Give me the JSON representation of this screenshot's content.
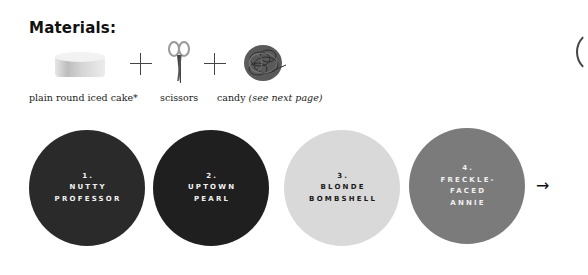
{
  "materials": {
    "title": "Materials:",
    "items": [
      {
        "icon": "cake-icon",
        "caption": "plain round iced cake*"
      },
      {
        "icon": "scissors-icon",
        "caption": "scissors"
      },
      {
        "icon": "candy-icon",
        "caption": "candy",
        "caption_note": "(see next page)"
      }
    ],
    "separator": "+"
  },
  "styles": [
    {
      "number": "1.",
      "lines": [
        "NUTTY",
        "PROFESSOR"
      ],
      "color": "#2a2a2a",
      "text_color": "#f2f2f2"
    },
    {
      "number": "2.",
      "lines": [
        "UPTOWN",
        "PEARL"
      ],
      "color": "#1f1f1f",
      "text_color": "#f2f2f2"
    },
    {
      "number": "3.",
      "lines": [
        "BLONDE",
        "BOMBSHELL"
      ],
      "color": "#d9d9d9",
      "text_color": "#1a1a1a"
    },
    {
      "number": "4.",
      "lines": [
        "FRECKLE-",
        "FACED",
        "ANNIE"
      ],
      "color": "#7b7b7b",
      "text_color": "#f0f0f0"
    }
  ],
  "next_arrow": "→"
}
